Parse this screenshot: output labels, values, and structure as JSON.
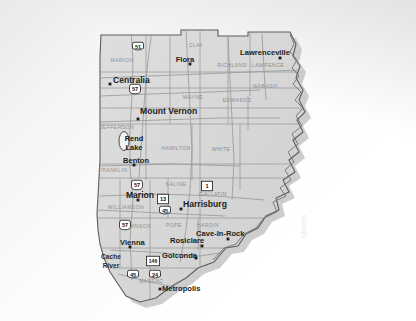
{
  "map": {
    "title": "Southern Illinois Region",
    "watermark": "Illinois",
    "base_fill": "#d8d8d8",
    "county_line_color": "#8a8a8a",
    "state_outline_color": "#555555",
    "road_color": "#9a9a9a",
    "shadow_color": "#bdbdbd",
    "lake_fill": "#ffffff",
    "city_dot_color": "#1a1a1a"
  },
  "counties": [
    {
      "name": "CLAY",
      "x": 196,
      "y": 47
    },
    {
      "name": "MARION",
      "x": 122,
      "y": 62
    },
    {
      "name": "RICHLAND",
      "x": 232,
      "y": 67
    },
    {
      "name": "LAWRENCE",
      "x": 268,
      "y": 67
    },
    {
      "name": "WABASH",
      "x": 265,
      "y": 88
    },
    {
      "name": "WAYNE",
      "x": 193,
      "y": 99
    },
    {
      "name": "EDWARDS",
      "x": 237,
      "y": 102
    },
    {
      "name": "JEFFERSON",
      "x": 117,
      "y": 129
    },
    {
      "name": "HAMILTON",
      "x": 176,
      "y": 150
    },
    {
      "name": "WHITE",
      "x": 221,
      "y": 151
    },
    {
      "name": "FRANKLIN",
      "x": 113,
      "y": 172
    },
    {
      "name": "SALINE",
      "x": 176,
      "y": 186
    },
    {
      "name": "GALLATIN",
      "x": 213,
      "y": 196
    },
    {
      "name": "WILLIAMSON",
      "x": 126,
      "y": 209
    },
    {
      "name": "JOHNSON",
      "x": 137,
      "y": 228
    },
    {
      "name": "POPE",
      "x": 174,
      "y": 227
    },
    {
      "name": "HARDIN",
      "x": 208,
      "y": 227
    },
    {
      "name": "MASSAC",
      "x": 151,
      "y": 283
    }
  ],
  "cities": [
    {
      "name": "Flora",
      "lx": 185,
      "ly": 62,
      "dx": 190,
      "dy": 64,
      "size": "sm",
      "anchor": "middle"
    },
    {
      "name": "Lawrenceville",
      "lx": 265,
      "ly": 55,
      "dx": 280,
      "dy": 58,
      "size": "sm",
      "anchor": "middle"
    },
    {
      "name": "Centralia",
      "lx": 113,
      "ly": 83,
      "dx": 110,
      "dy": 84,
      "size": "lg",
      "anchor": "start"
    },
    {
      "name": "Mount Vernon",
      "lx": 140,
      "ly": 114,
      "dx": 138,
      "dy": 119,
      "size": "lg",
      "anchor": "start"
    },
    {
      "name": "Benton",
      "lx": 136,
      "ly": 163,
      "dx": 134,
      "dy": 165,
      "size": "sm",
      "anchor": "middle"
    },
    {
      "name": "Marion",
      "lx": 140,
      "ly": 198,
      "dx": 138,
      "dy": 200,
      "size": "lg",
      "anchor": "middle"
    },
    {
      "name": "Harrisburg",
      "lx": 183,
      "ly": 207,
      "dx": 181,
      "dy": 209,
      "size": "lg",
      "anchor": "start"
    },
    {
      "name": "Cave-In-Rock",
      "lx": 196,
      "ly": 236,
      "dx": 228,
      "dy": 239,
      "size": "sm",
      "anchor": "start"
    },
    {
      "name": "Rosiclare",
      "lx": 170,
      "ly": 243,
      "dx": 202,
      "dy": 246,
      "size": "sm",
      "anchor": "start"
    },
    {
      "name": "Vienna",
      "lx": 120,
      "ly": 245,
      "dx": 130,
      "dy": 247,
      "size": "sm",
      "anchor": "start"
    },
    {
      "name": "Golconda",
      "lx": 162,
      "ly": 258,
      "dx": 196,
      "dy": 258,
      "size": "sm",
      "anchor": "start"
    },
    {
      "name": "Metropolis",
      "lx": 162,
      "ly": 291,
      "dx": 160,
      "dy": 289,
      "size": "sm",
      "anchor": "start"
    }
  ],
  "water_features": [
    {
      "name": "Rend Lake",
      "line1": "Rend",
      "line2": "Lake",
      "x": 134,
      "y": 141
    },
    {
      "name": "Cache River",
      "line1": "Cache",
      "line2": "River",
      "x": 111,
      "y": 259
    }
  ],
  "route_shields": [
    {
      "number": "51",
      "type": "us",
      "x": 138,
      "y": 47
    },
    {
      "number": "57",
      "type": "interstate",
      "x": 135,
      "y": 89
    },
    {
      "number": "57",
      "type": "interstate",
      "x": 137,
      "y": 185
    },
    {
      "number": "57",
      "type": "interstate",
      "x": 125,
      "y": 225
    },
    {
      "number": "1",
      "type": "state",
      "x": 207,
      "y": 186
    },
    {
      "number": "13",
      "type": "state",
      "x": 163,
      "y": 199
    },
    {
      "number": "45",
      "type": "us",
      "x": 165,
      "y": 211
    },
    {
      "number": "146",
      "type": "state",
      "x": 153,
      "y": 261
    },
    {
      "number": "45",
      "type": "us",
      "x": 133,
      "y": 275
    },
    {
      "number": "24",
      "type": "us",
      "x": 155,
      "y": 275
    }
  ]
}
